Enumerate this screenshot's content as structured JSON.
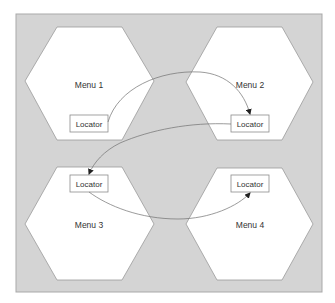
{
  "diagram": {
    "background": "#d4d4d4",
    "nodes": [
      {
        "id": "menu1",
        "label": "Menu 1",
        "locator": "Locator"
      },
      {
        "id": "menu2",
        "label": "Menu 2",
        "locator": "Locator"
      },
      {
        "id": "menu3",
        "label": "Menu 3",
        "locator": "Locator"
      },
      {
        "id": "menu4",
        "label": "Menu 4",
        "locator": "Locator"
      }
    ],
    "edges": [
      {
        "from": "menu1.locator",
        "to": "menu2.locator",
        "arrow": "end"
      },
      {
        "from": "menu2.locator",
        "to": "menu3.locator",
        "arrow": "end"
      },
      {
        "from": "menu3.locator",
        "to": "menu4.locator",
        "arrow": "end"
      }
    ]
  }
}
